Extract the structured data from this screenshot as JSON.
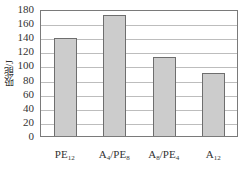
{
  "chart_data": {
    "type": "bar",
    "title": "",
    "xlabel": "",
    "ylabel": "吸能/J",
    "categories": [
      "PE12",
      "A4/PE8",
      "A8/PE4",
      "A12"
    ],
    "category_display": [
      {
        "base": "PE",
        "sub": "12"
      },
      {
        "base": "A",
        "sub": "4",
        "rest_base": "/PE",
        "rest_sub": "8"
      },
      {
        "base": "A",
        "sub": "8",
        "rest_base": "/PE",
        "rest_sub": "4"
      },
      {
        "base": "A",
        "sub": "12"
      }
    ],
    "values": [
      139,
      171,
      112,
      89
    ],
    "ylim": [
      0,
      180
    ],
    "yticks": [
      0,
      20,
      40,
      60,
      80,
      100,
      120,
      140,
      160,
      180
    ],
    "grid": true,
    "legend": null,
    "bar_color": "#cccccc",
    "bar_edge_color": "#6e6e6e"
  }
}
